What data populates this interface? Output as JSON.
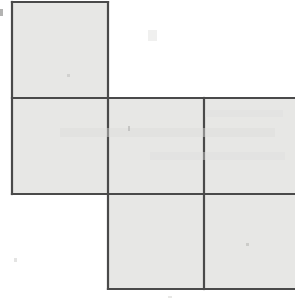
{
  "document": {
    "title": "Square Net Diagram",
    "type": "geometry-figure",
    "description": "Net of six squares arranged in a cross-like polyomino layout, cropped at the right edge of the page"
  },
  "canvas": {
    "width": 295,
    "height": 299,
    "background_color": "#ffffff"
  },
  "style": {
    "face_fill": "#e7e7e5",
    "stroke_color": "#4a4a4a",
    "stroke_width": 2.2,
    "page_tint": "#fbfbfa"
  },
  "geometry": {
    "cell_size": 96,
    "origin_x": 12,
    "origin_y": 2,
    "columns_x": [
      12,
      108,
      204,
      300
    ],
    "rows_y": [
      2,
      98,
      194,
      289
    ],
    "crop_right_at": 295
  },
  "chart_data": {
    "type": "diagram",
    "xlabel": "",
    "ylabel": "",
    "grid": false,
    "squares": [
      {
        "name": "top-square",
        "row": 0,
        "col": 0,
        "x": 12,
        "y": 2,
        "width": 96,
        "height": 96,
        "clipped": false
      },
      {
        "name": "middle-left-square",
        "row": 1,
        "col": 0,
        "x": 12,
        "y": 98,
        "width": 96,
        "height": 96,
        "clipped": false
      },
      {
        "name": "middle-center-square",
        "row": 1,
        "col": 1,
        "x": 108,
        "y": 98,
        "width": 96,
        "height": 96,
        "clipped": false
      },
      {
        "name": "middle-right-square",
        "row": 1,
        "col": 2,
        "x": 204,
        "y": 98,
        "width": 96,
        "height": 96,
        "clipped": true
      },
      {
        "name": "bottom-center-square",
        "row": 2,
        "col": 1,
        "x": 108,
        "y": 194,
        "width": 96,
        "height": 95,
        "clipped": false
      },
      {
        "name": "bottom-right-square",
        "row": 2,
        "col": 2,
        "x": 204,
        "y": 194,
        "width": 96,
        "height": 95,
        "clipped": true
      }
    ],
    "edges": [
      {
        "name": "top-square-top-edge",
        "x1": 12,
        "y1": 2,
        "x2": 108,
        "y2": 2
      },
      {
        "name": "top-square-left-edge",
        "x1": 12,
        "y1": 2,
        "x2": 12,
        "y2": 194
      },
      {
        "name": "top-square-right-edge",
        "x1": 108,
        "y1": 2,
        "x2": 108,
        "y2": 289
      },
      {
        "name": "middle-row-top-edge",
        "x1": 12,
        "y1": 98,
        "x2": 295,
        "y2": 98
      },
      {
        "name": "middle-row-bottom-edge",
        "x1": 12,
        "y1": 194,
        "x2": 295,
        "y2": 194
      },
      {
        "name": "inner-vertical-divider",
        "x1": 204,
        "y1": 98,
        "x2": 204,
        "y2": 289
      },
      {
        "name": "bottom-row-bottom-edge",
        "x1": 108,
        "y1": 289,
        "x2": 295,
        "y2": 289
      }
    ],
    "counts": {
      "visible_squares": 6,
      "rows": 3,
      "columns": 3
    }
  },
  "artifacts": [
    {
      "name": "left-margin-speck",
      "x": 0,
      "y": 9,
      "width": 3,
      "height": 7,
      "color": "#9a9a98",
      "opacity": 0.75
    },
    {
      "name": "page-smudge-upper",
      "x": 148,
      "y": 30,
      "width": 9,
      "height": 11,
      "color": "#e4e4e2",
      "opacity": 0.55
    },
    {
      "name": "ghost-text-band-a",
      "x": 60,
      "y": 128,
      "width": 215,
      "height": 9,
      "color": "#dcdcda",
      "opacity": 0.45
    },
    {
      "name": "ghost-text-band-b",
      "x": 150,
      "y": 152,
      "width": 135,
      "height": 8,
      "color": "#dedede",
      "opacity": 0.4
    },
    {
      "name": "ghost-text-band-c",
      "x": 205,
      "y": 110,
      "width": 78,
      "height": 7,
      "color": "#dedede",
      "opacity": 0.4
    },
    {
      "name": "center-fleck",
      "x": 128,
      "y": 126,
      "width": 2,
      "height": 5,
      "color": "#b8b8b6",
      "opacity": 0.7
    },
    {
      "name": "lower-right-fleck",
      "x": 246,
      "y": 243,
      "width": 3,
      "height": 3,
      "color": "#c0c0be",
      "opacity": 0.7
    },
    {
      "name": "top-square-fleck",
      "x": 67,
      "y": 74,
      "width": 3,
      "height": 3,
      "color": "#c8c8c6",
      "opacity": 0.7
    },
    {
      "name": "bottom-left-speck",
      "x": 14,
      "y": 258,
      "width": 3,
      "height": 4,
      "color": "#d2d2d0",
      "opacity": 0.6
    },
    {
      "name": "bottom-edge-speck",
      "x": 168,
      "y": 296,
      "width": 4,
      "height": 2,
      "color": "#d8d8d6",
      "opacity": 0.6
    }
  ]
}
